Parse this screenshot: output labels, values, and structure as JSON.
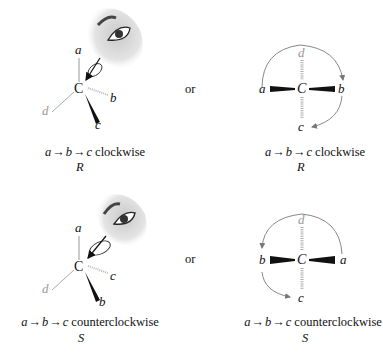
{
  "panels": [
    {
      "id": "R-top",
      "perspective": {
        "center": "C",
        "up": "a",
        "right": "b",
        "front": "c",
        "back_left": "d"
      },
      "fischer": {
        "center": "C",
        "top": "d",
        "left": "a",
        "right": "b",
        "bottom": "c"
      },
      "connector": "or",
      "caption_left": {
        "seq": [
          "a",
          "b",
          "c"
        ],
        "direction": "clockwise",
        "config": "R"
      },
      "caption_right": {
        "seq": [
          "a",
          "b",
          "c"
        ],
        "direction": "clockwise",
        "config": "R"
      }
    },
    {
      "id": "S-bottom",
      "perspective": {
        "center": "C",
        "up": "a",
        "right": "c",
        "front": "b",
        "back_left": "d"
      },
      "fischer": {
        "center": "C",
        "top": "d",
        "left": "b",
        "right": "a",
        "bottom": "c"
      },
      "connector": "or",
      "caption_left": {
        "seq": [
          "a",
          "b",
          "c"
        ],
        "direction": "counterclockwise",
        "config": "S"
      },
      "caption_right": {
        "seq": [
          "a",
          "b",
          "c"
        ],
        "direction": "counterclockwise",
        "config": "S"
      }
    }
  ],
  "arrow_glyph": "→",
  "colors": {
    "ink": "#111111",
    "faded": "#9a9a9a",
    "eye_shade": "#d8d8d8"
  }
}
